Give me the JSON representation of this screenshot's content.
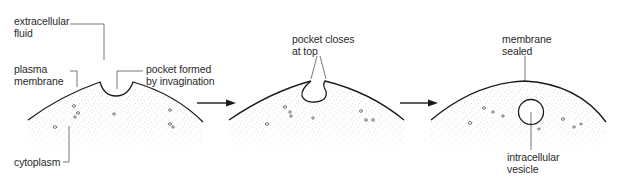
{
  "diagram": {
    "stages": [
      {
        "id": "stage-1",
        "labels": {
          "extracellular_fluid": [
            "extracellular",
            "fluid"
          ],
          "plasma_membrane": [
            "plasma",
            "membrane"
          ],
          "pocket_formed": [
            "pocket formed",
            "by invagination"
          ],
          "cytoplasm": [
            "cytoplasm"
          ]
        }
      },
      {
        "id": "stage-2",
        "labels": {
          "pocket_closes": [
            "pocket closes",
            "at top"
          ]
        }
      },
      {
        "id": "stage-3",
        "labels": {
          "membrane_sealed": [
            "membrane",
            "sealed"
          ],
          "intracellular_vesicle": [
            "intracellular",
            "vesicle"
          ]
        }
      }
    ],
    "arrows": [
      {
        "from": "stage-1",
        "to": "stage-2"
      },
      {
        "from": "stage-2",
        "to": "stage-3"
      }
    ],
    "colors": {
      "line": "#1a1a1a",
      "stipple": "#9a9a9a",
      "leader": "#555555",
      "background": "#ffffff"
    }
  }
}
